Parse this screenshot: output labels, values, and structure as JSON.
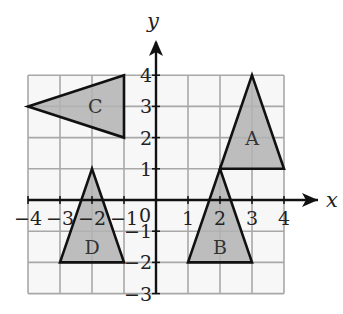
{
  "chart_data": {
    "type": "coordinate-grid",
    "xlabel": "x",
    "ylabel": "y",
    "xlim": [
      -4,
      4
    ],
    "ylim": [
      -3,
      4
    ],
    "grid": true,
    "x_ticks": [
      "-4",
      "-3",
      "-2",
      "-1",
      "1",
      "2",
      "3",
      "4"
    ],
    "y_ticks": [
      "4",
      "3",
      "2",
      "1",
      "-1",
      "-2",
      "-3"
    ],
    "origin_label": "0",
    "shapes": [
      {
        "name": "A",
        "vertices": [
          [
            3,
            4
          ],
          [
            2,
            1
          ],
          [
            4,
            1
          ]
        ],
        "label_pos": [
          3,
          2
        ]
      },
      {
        "name": "B",
        "vertices": [
          [
            2,
            1
          ],
          [
            1,
            -2
          ],
          [
            3,
            -2
          ]
        ],
        "label_pos": [
          2,
          -1.5
        ]
      },
      {
        "name": "C",
        "vertices": [
          [
            -1,
            4
          ],
          [
            -4,
            3
          ],
          [
            -1,
            2
          ]
        ],
        "label_pos": [
          -1.9,
          3
        ]
      },
      {
        "name": "D",
        "vertices": [
          [
            -2,
            1
          ],
          [
            -3,
            -2
          ],
          [
            -1,
            -2
          ]
        ],
        "label_pos": [
          -2,
          -1.5
        ]
      }
    ],
    "fill_color": "#b3b3b3",
    "grid_color": "#a8a8a8"
  }
}
